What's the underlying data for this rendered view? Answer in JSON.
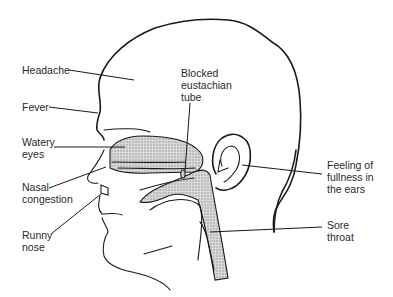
{
  "diagram": {
    "shade_color": "#bdbdbd",
    "line_color": "#1a1a1a",
    "labels": {
      "headache": "Headache",
      "fever": "Fever",
      "watery_eyes": "Watery\neyes",
      "nasal_congestion": "Nasal\ncongestion",
      "runny_nose": "Runny\nnose",
      "blocked_eustachian_tube": "Blocked\neustachian\ntube",
      "fullness_ears": "Feeling of\nfullness in\nthe ears",
      "sore_throat": "Sore\nthroat"
    }
  }
}
